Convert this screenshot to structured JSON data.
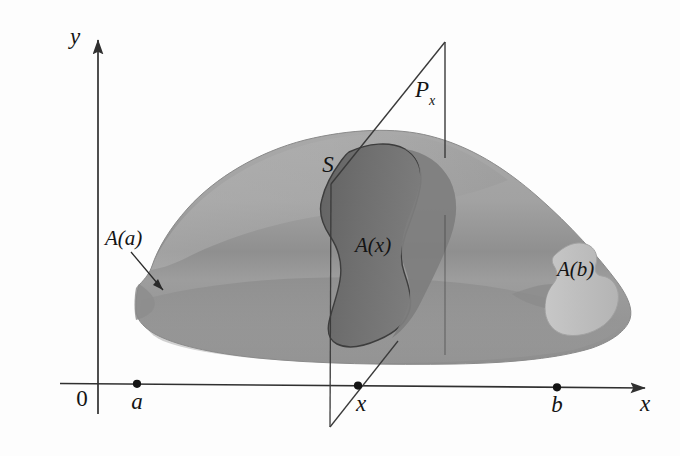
{
  "figure": {
    "background_color": "#fdfdfd",
    "axes": {
      "y_axis_label": "y",
      "x_axis_label": "x",
      "origin_label": "0",
      "axis_color": "#303030"
    },
    "tick_points": [
      {
        "name": "a",
        "label": "a",
        "x": 137,
        "y": 384
      },
      {
        "name": "x",
        "label": "x",
        "x": 358,
        "y": 387
      },
      {
        "name": "b",
        "label": "b",
        "x": 557,
        "y": 390
      }
    ],
    "labels": {
      "solid": "S",
      "plane": "P",
      "plane_subscript": "x",
      "area_at_a": "A(a)",
      "area_at_x": "A(x)",
      "area_at_b": "A(b)"
    },
    "colors": {
      "solid_body_light": "#a6a6a6",
      "solid_body_mid": "#9a9a9a",
      "solid_body_dark": "#8a8a8a",
      "cross_section_dark": "#6e6e6e",
      "cross_section_light": "#c2c2c2",
      "outline": "#4a4a4a",
      "text": "#141414"
    }
  }
}
